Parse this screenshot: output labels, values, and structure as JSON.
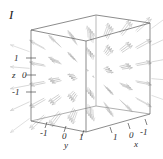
{
  "figure": {
    "label": "I",
    "width": 163,
    "height": 159,
    "background": "#ffffff"
  },
  "axes": {
    "z": {
      "name": "z",
      "ticks": [
        "1",
        "0",
        "-1"
      ],
      "range": [
        -1.5,
        1.5
      ]
    },
    "y": {
      "name": "y",
      "ticks": [
        "-1",
        "0",
        "1"
      ],
      "range": [
        -1.5,
        1.5
      ]
    },
    "x": {
      "name": "x",
      "ticks": [
        "1",
        "0",
        "-1"
      ],
      "range": [
        -1.5,
        1.5
      ]
    }
  },
  "colors": {
    "frame": "#555555",
    "arrow": "#b9b9b9",
    "arrow_dark": "#9a9a9a",
    "text": "#2a2a2a"
  },
  "chart_data": {
    "type": "scatter",
    "plot_kind": "3d-vector-field",
    "title": "",
    "xlabel": "x",
    "ylabel": "y",
    "zlabel": "z",
    "xlim": [
      -1.5,
      1.5
    ],
    "ylim": [
      -1.5,
      1.5
    ],
    "zlim": [
      -1.5,
      1.5
    ],
    "xticks": [
      "1",
      "0",
      "-1"
    ],
    "yticks": [
      "-1",
      "0",
      "1"
    ],
    "zticks": [
      "1",
      "0",
      "-1"
    ],
    "grid": false,
    "legend": null,
    "field_expression": "F(x,y,z) = (x, y, z)",
    "sample_grid": [
      -1.2,
      -0.6,
      0,
      0.6,
      1.2
    ],
    "series": [
      {
        "name": "vector-field",
        "points": [
          {
            "x": -1.2,
            "y": -1.2,
            "z": -1.2,
            "u": -1.2,
            "v": -1.2,
            "w": -1.2
          },
          {
            "x": -1.2,
            "y": -1.2,
            "z": 0.0,
            "u": -1.2,
            "v": -1.2,
            "w": 0.0
          },
          {
            "x": -1.2,
            "y": -1.2,
            "z": 1.2,
            "u": -1.2,
            "v": -1.2,
            "w": 1.2
          },
          {
            "x": -1.2,
            "y": 0.0,
            "z": -1.2,
            "u": -1.2,
            "v": 0.0,
            "w": -1.2
          },
          {
            "x": -1.2,
            "y": 0.0,
            "z": 0.0,
            "u": -1.2,
            "v": 0.0,
            "w": 0.0
          },
          {
            "x": -1.2,
            "y": 0.0,
            "z": 1.2,
            "u": -1.2,
            "v": 0.0,
            "w": 1.2
          },
          {
            "x": -1.2,
            "y": 1.2,
            "z": -1.2,
            "u": -1.2,
            "v": 1.2,
            "w": -1.2
          },
          {
            "x": -1.2,
            "y": 1.2,
            "z": 0.0,
            "u": -1.2,
            "v": 1.2,
            "w": 0.0
          },
          {
            "x": -1.2,
            "y": 1.2,
            "z": 1.2,
            "u": -1.2,
            "v": 1.2,
            "w": 1.2
          },
          {
            "x": 0.0,
            "y": -1.2,
            "z": -1.2,
            "u": 0.0,
            "v": -1.2,
            "w": -1.2
          },
          {
            "x": 0.0,
            "y": -1.2,
            "z": 0.0,
            "u": 0.0,
            "v": -1.2,
            "w": 0.0
          },
          {
            "x": 0.0,
            "y": -1.2,
            "z": 1.2,
            "u": 0.0,
            "v": -1.2,
            "w": 1.2
          },
          {
            "x": 0.0,
            "y": 0.0,
            "z": -1.2,
            "u": 0.0,
            "v": 0.0,
            "w": -1.2
          },
          {
            "x": 0.0,
            "y": 0.0,
            "z": 1.2,
            "u": 0.0,
            "v": 0.0,
            "w": 1.2
          },
          {
            "x": 0.0,
            "y": 1.2,
            "z": -1.2,
            "u": 0.0,
            "v": 1.2,
            "w": -1.2
          },
          {
            "x": 0.0,
            "y": 1.2,
            "z": 0.0,
            "u": 0.0,
            "v": 1.2,
            "w": 0.0
          },
          {
            "x": 0.0,
            "y": 1.2,
            "z": 1.2,
            "u": 0.0,
            "v": 1.2,
            "w": 1.2
          },
          {
            "x": 1.2,
            "y": -1.2,
            "z": -1.2,
            "u": 1.2,
            "v": -1.2,
            "w": -1.2
          },
          {
            "x": 1.2,
            "y": -1.2,
            "z": 0.0,
            "u": 1.2,
            "v": -1.2,
            "w": 0.0
          },
          {
            "x": 1.2,
            "y": -1.2,
            "z": 1.2,
            "u": 1.2,
            "v": -1.2,
            "w": 1.2
          },
          {
            "x": 1.2,
            "y": 0.0,
            "z": -1.2,
            "u": 1.2,
            "v": 0.0,
            "w": -1.2
          },
          {
            "x": 1.2,
            "y": 0.0,
            "z": 0.0,
            "u": 1.2,
            "v": 0.0,
            "w": 0.0
          },
          {
            "x": 1.2,
            "y": 0.0,
            "z": 1.2,
            "u": 1.2,
            "v": 0.0,
            "w": 1.2
          },
          {
            "x": 1.2,
            "y": 1.2,
            "z": -1.2,
            "u": 1.2,
            "v": 1.2,
            "w": -1.2
          },
          {
            "x": 1.2,
            "y": 1.2,
            "z": 0.0,
            "u": 1.2,
            "v": 1.2,
            "w": 0.0
          },
          {
            "x": 1.2,
            "y": 1.2,
            "z": 1.2,
            "u": 1.2,
            "v": 1.2,
            "w": 1.2
          }
        ]
      }
    ]
  }
}
